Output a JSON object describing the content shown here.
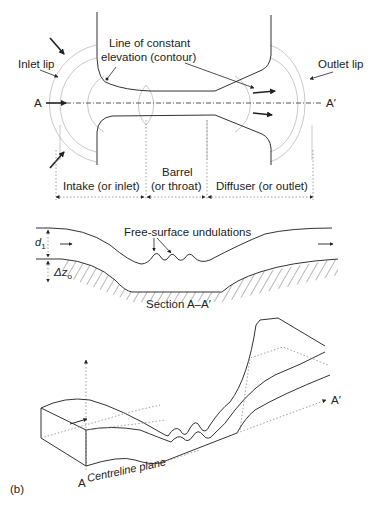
{
  "plan_view": {
    "labels": {
      "contour": [
        "Line of constant",
        "elevation (contour)"
      ],
      "inlet_lip": "Inlet lip",
      "outlet_lip": "Outlet lip",
      "section_start": "A",
      "section_end": "A′"
    },
    "zones": {
      "intake": "Intake (or inlet)",
      "barrel": [
        "Barrel",
        "(or throat)"
      ],
      "diffuser": "Diffuser (or outlet)"
    }
  },
  "section_view": {
    "depth_label": "d",
    "depth_sub": "1",
    "drop_label": "Δz",
    "drop_sub": "o",
    "undulations": "Free-surface undulations",
    "caption": "Section A–A′"
  },
  "isometric_view": {
    "start": "A",
    "end": "A′",
    "plane": "Centreline plane"
  },
  "figure_label": "(b)"
}
